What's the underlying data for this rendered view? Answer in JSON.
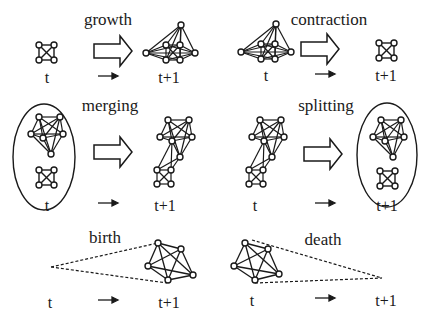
{
  "panels": [
    {
      "id": "growth",
      "title": "growth",
      "from_label": "t",
      "to_label": "t+1"
    },
    {
      "id": "contraction",
      "title": "contraction",
      "from_label": "t",
      "to_label": "t+1"
    },
    {
      "id": "merging",
      "title": "merging",
      "from_label": "t",
      "to_label": "t+1"
    },
    {
      "id": "splitting",
      "title": "splitting",
      "from_label": "t",
      "to_label": "t+1"
    },
    {
      "id": "birth",
      "title": "birth",
      "from_label": "t",
      "to_label": "t+1"
    },
    {
      "id": "death",
      "title": "death",
      "from_label": "t",
      "to_label": "t+1"
    }
  ],
  "colors": {
    "stroke": "#1a1a1a",
    "background": "#ffffff"
  }
}
